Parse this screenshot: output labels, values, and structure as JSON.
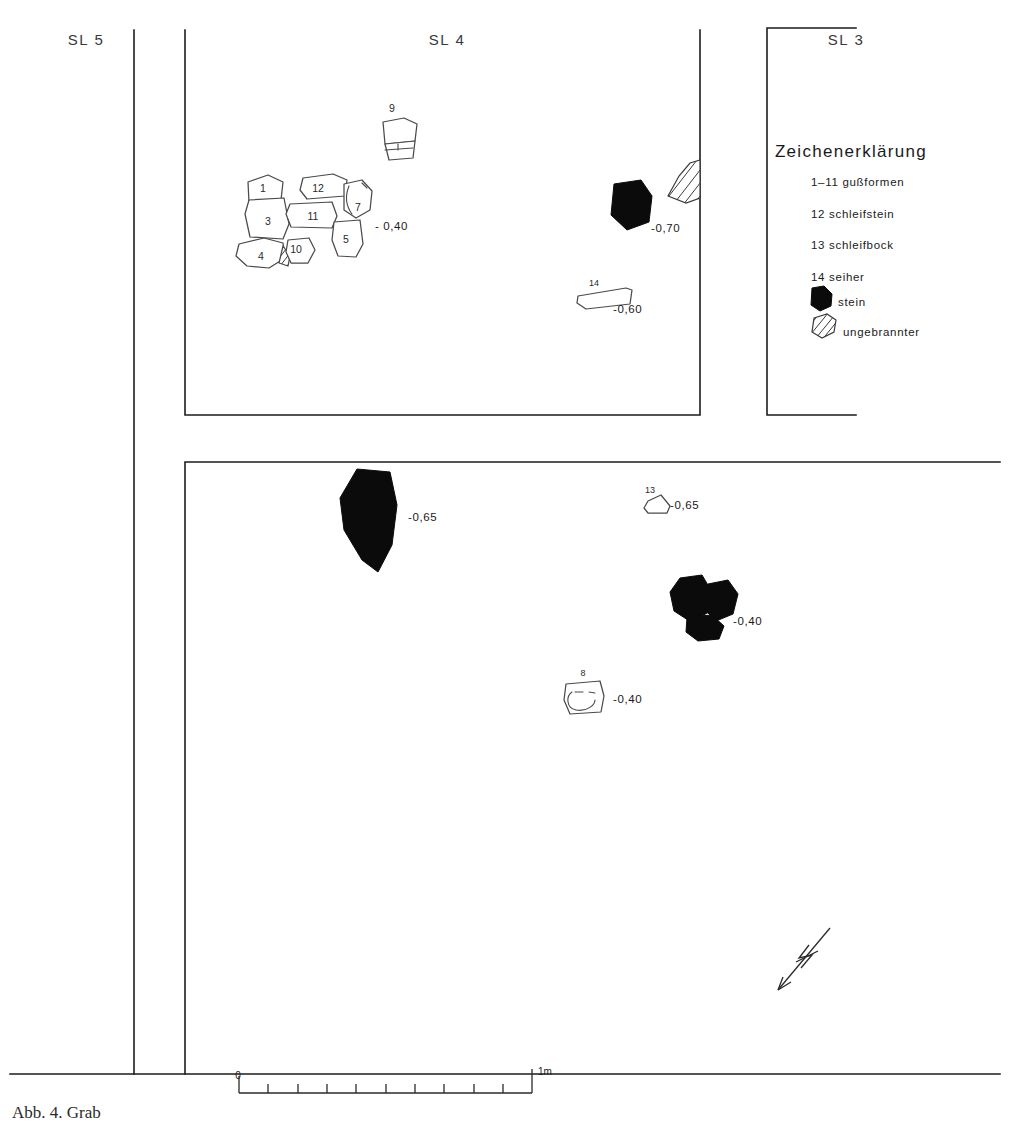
{
  "plan": {
    "title_cut": "Abb. 4. Grab",
    "sections": [
      {
        "id": "sl5",
        "label": "SL 5",
        "x": 86,
        "y": 45
      },
      {
        "id": "sl4",
        "label": "SL 4",
        "x": 447,
        "y": 45
      },
      {
        "id": "sl3",
        "label": "SL 3",
        "x": 846,
        "y": 45
      }
    ],
    "legend": {
      "title": "Zeichenerklärung",
      "entries": [
        {
          "key": "1-11",
          "label": "1–11 gußformen"
        },
        {
          "key": "12",
          "label": "12 schleifstein"
        },
        {
          "key": "13",
          "label": "13 schleifbock"
        },
        {
          "key": "14",
          "label": "14 seiher"
        },
        {
          "key": "stein",
          "label": "stein",
          "symbol": "stone-symbol"
        },
        {
          "key": "ungebrannter",
          "label": "ungebrannter",
          "symbol": "unfired-symbol"
        }
      ]
    },
    "artifacts": [
      {
        "num": "1",
        "label_x": 263,
        "label_y": 192
      },
      {
        "num": "3",
        "label_x": 268,
        "label_y": 223
      },
      {
        "num": "4",
        "label_x": 261,
        "label_y": 258
      },
      {
        "num": "5",
        "label_x": 345,
        "label_y": 241
      },
      {
        "num": "7",
        "label_x": 357,
        "label_y": 210
      },
      {
        "num": "10",
        "label_x": 293,
        "label_y": 251
      },
      {
        "num": "11",
        "label_x": 313,
        "label_y": 213
      },
      {
        "num": "12",
        "label_x": 318,
        "label_y": 189
      },
      {
        "num": "9",
        "label_x": 392,
        "label_y": 112
      },
      {
        "num": "14",
        "label_x": 592,
        "label_y": 285
      },
      {
        "num": "13",
        "label_x": 650,
        "label_y": 494
      },
      {
        "num": "8",
        "label_x": 583,
        "label_y": 675
      }
    ],
    "depths": [
      {
        "value": "- 0,40",
        "x": 375,
        "y": 230
      },
      {
        "value": "-0,70",
        "x": 651,
        "y": 232
      },
      {
        "value": "-0,60",
        "x": 613,
        "y": 313
      },
      {
        "value": "-0,65",
        "x": 408,
        "y": 521
      },
      {
        "value": "-0,65",
        "x": 670,
        "y": 509
      },
      {
        "value": "-0,40",
        "x": 733,
        "y": 625
      },
      {
        "value": "-0,40",
        "x": 613,
        "y": 703
      }
    ],
    "scale_bar": {
      "start_label": "0",
      "end_label": "1m",
      "divisions": 10
    },
    "north_arrow": {
      "glyph": "N"
    }
  }
}
